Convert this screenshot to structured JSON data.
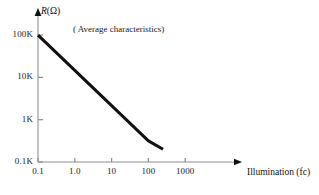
{
  "chart_data": {
    "type": "line",
    "title": "",
    "annotation": "( Average characteristics)",
    "xlabel": "Illumination (fc)",
    "ylabel": "R(Ω)",
    "ylabel_symbol": "R",
    "ylabel_unit": "(Ω)",
    "xscale": "log",
    "yscale": "log",
    "grid": false,
    "legend": "none",
    "xlim": [
      0.1,
      2000
    ],
    "ylim": [
      100,
      100000
    ],
    "xticks": [
      "0.1",
      "1.0",
      "10",
      "100",
      "1000"
    ],
    "xtick_values": [
      0.1,
      1.0,
      10,
      100,
      1000
    ],
    "yticks": [
      "0.1K",
      "1K",
      "10K",
      "100K"
    ],
    "ytick_values": [
      100,
      1000,
      10000,
      100000
    ],
    "series": [
      {
        "name": "Average characteristics",
        "x": [
          0.1,
          1.0,
          10,
          100,
          250
        ],
        "y": [
          100000,
          14700,
          2150,
          316,
          200
        ],
        "color": "#111111",
        "linewidth": 3
      }
    ],
    "axis_color": "#b4b4b4",
    "text_color": "#1a1a1a"
  },
  "geometry": {
    "origin_x": 38,
    "origin_y": 162,
    "x_decade_px": 36.8,
    "y_decade_px": 42.3,
    "x_axis_end": 242,
    "y_axis_top": 10
  }
}
